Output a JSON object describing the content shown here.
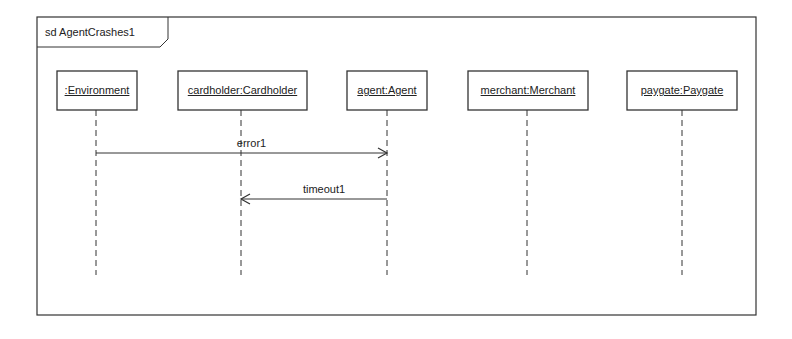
{
  "frame": {
    "title": "sd AgentCrashes1",
    "x": 37,
    "y": 17,
    "w": 719,
    "h": 298,
    "tab_w": 131,
    "tab_h": 30
  },
  "lifelines": [
    {
      "name": ":Environment",
      "cx": 96,
      "box_x": 57,
      "box_w": 80
    },
    {
      "name": "cardholder:Cardholder",
      "cx": 241,
      "box_x": 178,
      "box_w": 129
    },
    {
      "name": "agent:Agent",
      "cx": 387,
      "box_x": 347,
      "box_w": 80
    },
    {
      "name": "merchant:Merchant",
      "cx": 527,
      "box_x": 468,
      "box_w": 120
    },
    {
      "name": "paygate:Paygate",
      "cx": 682,
      "box_x": 627,
      "box_w": 110
    }
  ],
  "lifeline_box_y": 71,
  "lifeline_box_h": 39,
  "lifeline_end_y": 275,
  "messages": [
    {
      "label": "error1",
      "from": 0,
      "to": 2,
      "y": 153
    },
    {
      "label": "timeout1",
      "from": 2,
      "to": 1,
      "y": 199
    }
  ],
  "colors": {
    "line": "#333333",
    "background": "#ffffff"
  }
}
